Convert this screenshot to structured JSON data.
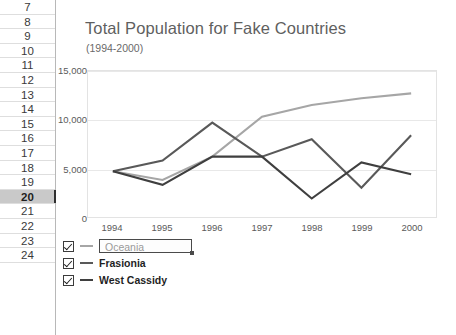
{
  "spreadsheet": {
    "row_headers": [
      "7",
      "8",
      "9",
      "10",
      "11",
      "12",
      "13",
      "14",
      "15",
      "16",
      "17",
      "18",
      "19",
      "20",
      "21",
      "22",
      "23",
      "24"
    ],
    "selected_row": "20"
  },
  "chart_data": {
    "type": "line",
    "title": "Total Population for Fake Countries",
    "subtitle": "(1994-2000)",
    "xlabel": "",
    "ylabel": "",
    "categories": [
      "1994",
      "1995",
      "1996",
      "1997",
      "1998",
      "1999",
      "2000"
    ],
    "ylim": [
      0,
      15000
    ],
    "yticks": [
      "0",
      "5,000",
      "10,000",
      "15,000"
    ],
    "ytick_values": [
      0,
      5000,
      10000,
      15000
    ],
    "grid": true,
    "legend_position": "bottom-left",
    "series": [
      {
        "name": "Oceania",
        "color": "#a6a6a6",
        "values": [
          4700,
          3800,
          6200,
          10300,
          11500,
          12200,
          12700
        ]
      },
      {
        "name": "Frasionia",
        "color": "#595959",
        "values": [
          4700,
          5800,
          9700,
          6200,
          8000,
          3000,
          8400
        ]
      },
      {
        "name": "West Cassidy",
        "color": "#3f3f3f",
        "values": [
          4700,
          3300,
          6200,
          6200,
          1900,
          5600,
          4400
        ]
      }
    ]
  },
  "legend": {
    "items": [
      {
        "label": "Oceania",
        "checked": true,
        "editing": true
      },
      {
        "label": "Frasionia",
        "checked": true,
        "editing": false
      },
      {
        "label": "West Cassidy",
        "checked": true,
        "editing": false
      }
    ]
  }
}
